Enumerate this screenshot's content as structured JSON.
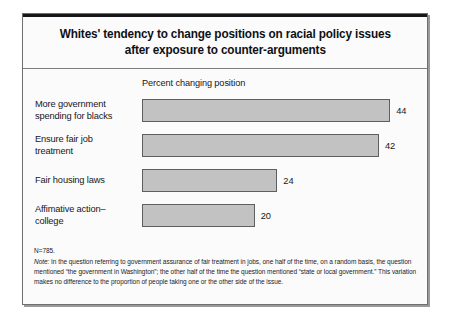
{
  "figure": {
    "title": "Whites' tendency to change positions on racial policy issues after exposure to counter-arguments",
    "title_line_1": "Whites' tendency to change positions on racial policy issues",
    "title_line_2": "after exposure to counter-arguments",
    "axis_caption": "Percent changing position",
    "sample_size_note": "N=785.",
    "note_label": "Note:",
    "note_text": " In the question referring to government assurance of fair treatment in jobs, one half of the time, on a random basis, the question mentioned “the government in Washington”; the other half of the time the question mentioned “state or local government.” This variation makes no difference to the proportion of people taking one or the other side of the issue.",
    "colors": {
      "bar_fill": "#c2c2c2",
      "bar_border": "#5f5f5f",
      "frame_border": "#6f6f6f",
      "text": "#17171b",
      "background": "#fbfbfb"
    }
  },
  "chart_data": {
    "type": "bar",
    "orientation": "horizontal",
    "title": "Whites' tendency to change positions on racial policy issues after exposure to counter-arguments",
    "xlabel": "Percent changing position",
    "ylabel": "",
    "xlim": [
      0,
      50
    ],
    "grid": false,
    "legend": false,
    "categories": [
      "More government spending for blacks",
      "Ensure fair job treatment",
      "Fair housing laws",
      "Affimative action–college"
    ],
    "values": [
      44,
      42,
      24,
      20
    ],
    "value_labels": [
      "44",
      "42",
      "24",
      "20"
    ],
    "bars": [
      {
        "label_line_1": "More government",
        "label_line_2": "spending for blacks",
        "value": 44,
        "value_label": "44"
      },
      {
        "label_line_1": "Ensure fair job",
        "label_line_2": "treatment",
        "value": 42,
        "value_label": "42"
      },
      {
        "label_line_1": "Fair housing laws",
        "label_line_2": "",
        "value": 24,
        "value_label": "24"
      },
      {
        "label_line_1": "Affimative action–",
        "label_line_2": "college",
        "value": 20,
        "value_label": "20"
      }
    ],
    "annotations": [
      "N=785.",
      "Note: In the question referring to government assurance of fair treatment in jobs, one half of the time, on a random basis, the question mentioned “the government in Washington”; the other half of the time the question mentioned “state or local government.” This variation makes no difference to the proportion of people taking one or the other side of the issue."
    ]
  }
}
